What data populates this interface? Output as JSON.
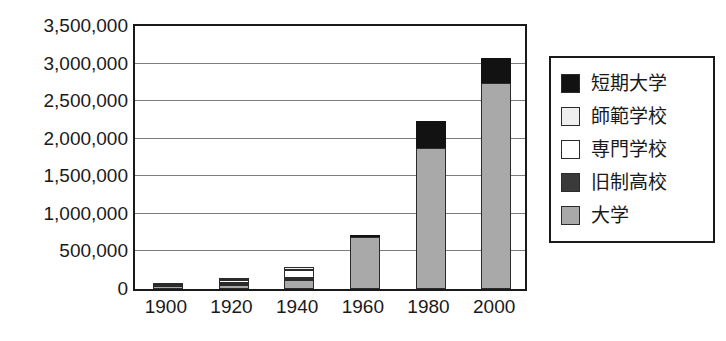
{
  "chart_data": {
    "type": "bar",
    "stacked": true,
    "title": "",
    "subtitle": "",
    "xlabel": "",
    "ylabel": "",
    "categories": [
      "1900",
      "1920",
      "1940",
      "1960",
      "1980",
      "2000"
    ],
    "ylim": [
      0,
      3500000
    ],
    "ytick_labels": [
      "3,500,000",
      "3,000,000",
      "2,500,000",
      "2,000,000",
      "1,500,000",
      "1,000,000",
      "500,000",
      "0"
    ],
    "ytick_values": [
      3500000,
      3000000,
      2500000,
      2000000,
      1500000,
      1000000,
      500000,
      0
    ],
    "ytick_step": 500000,
    "grid": true,
    "grid_axis": "y",
    "legend_position": "right",
    "series": [
      {
        "name": "大学",
        "color": "#a9a9a9",
        "values": [
          35000,
          60000,
          120000,
          690000,
          1870000,
          2740000
        ]
      },
      {
        "name": "旧制高校",
        "color": "#3a3a3a",
        "values": [
          10000,
          15000,
          25000,
          0,
          0,
          0
        ]
      },
      {
        "name": "専門学校",
        "color": "#ffffff",
        "values": [
          15000,
          45000,
          105000,
          0,
          0,
          0
        ]
      },
      {
        "name": "師範学校",
        "color": "#efefef",
        "values": [
          8000,
          20000,
          45000,
          0,
          0,
          0
        ]
      },
      {
        "name": "短期大学",
        "color": "#121212",
        "values": [
          0,
          0,
          0,
          25000,
          360000,
          340000
        ]
      }
    ],
    "totals": [
      68000,
      140000,
      295000,
      715000,
      2230000,
      3080000
    ]
  },
  "legend": {
    "entries": [
      {
        "label": "短期大学",
        "color": "#121212"
      },
      {
        "label": "師範学校",
        "color": "#efefef"
      },
      {
        "label": "専門学校",
        "color": "#ffffff"
      },
      {
        "label": "旧制高校",
        "color": "#3a3a3a"
      },
      {
        "label": "大学",
        "color": "#a9a9a9"
      }
    ]
  },
  "colors": {
    "axis": "#1a1a1a",
    "gridline": "#7d7d7d",
    "plot_background": "#ffffff",
    "page_background": "#ffffff"
  }
}
